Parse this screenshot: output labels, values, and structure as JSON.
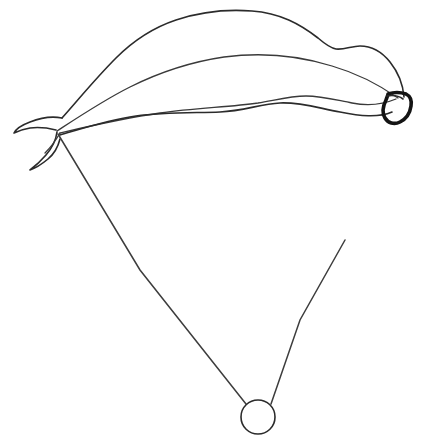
{
  "image": {
    "title": "Parachute line drawing",
    "kind": "line-art",
    "background_color": "#ffffff",
    "ink_color": "#2b2b2b",
    "heavy_ink_color": "#141414",
    "width": 426,
    "height": 446
  },
  "figure": {
    "parts": [
      {
        "name": "canopy-top-edge",
        "label": "Canopy upper outline"
      },
      {
        "name": "canopy-mid-seam",
        "label": "Canopy middle seam"
      },
      {
        "name": "canopy-inner-seam",
        "label": "Canopy inner seam"
      },
      {
        "name": "canopy-bottom-edge",
        "label": "Canopy lower outline"
      },
      {
        "name": "canopy-left-tip",
        "label": "Left canopy tip"
      },
      {
        "name": "canopy-right-tip",
        "label": "Right canopy tip hook"
      },
      {
        "name": "suspension-line-left",
        "label": "Left suspension line"
      },
      {
        "name": "suspension-line-right",
        "label": "Right suspension line"
      },
      {
        "name": "payload-ring",
        "label": "Payload ring"
      }
    ]
  },
  "geometry": {
    "canopy_top_peak": {
      "x": 250,
      "y": 11
    },
    "canopy_left_tip": {
      "x": 18,
      "y": 127
    },
    "canopy_right_tip": {
      "x": 404,
      "y": 100
    },
    "line_left_anchor": {
      "x": 58,
      "y": 134
    },
    "line_right_anchor": {
      "x": 345,
      "y": 240
    },
    "ring_center": {
      "x": 258,
      "y": 417
    },
    "ring_radius": 17
  },
  "paths": {
    "canopy_top_edge": "M 62,118 C 78,100 96,78 116,58 C 134,40 152,28 176,20 C 200,12 226,9 252,11 C 280,13 300,24 318,38 C 325,44 330,48 336,49 C 344,50 352,46 360,46 C 372,46 382,52 390,62 C 398,72 403,84 404,97",
    "canopy_mid_seam": "M 57,131 C 80,116 104,100 130,87 C 158,73 190,62 224,57 C 262,52 300,56 332,66 C 356,73 378,84 398,98",
    "canopy_inner_seam": "M 60,133 C 90,126 124,118 160,113 C 196,108 230,107 258,103 C 276,100 290,96 306,96 C 322,96 336,100 352,103 C 368,106 384,104 396,99",
    "canopy_bottom_edge": "M 60,135 C 84,128 108,120 136,116 C 164,112 196,113 220,112 C 244,111 260,104 280,103 C 300,102 318,108 340,112 C 360,116 378,118 392,112",
    "canopy_left_tip_upper": "M 62,118 C 52,116 40,118 30,122 C 22,125 16,129 14,133 C 18,131 24,129 30,128 C 38,127 48,128 56,130",
    "canopy_left_tip_lower": "M 57,132 C 56,140 52,148 46,155 C 40,162 34,167 30,170 C 36,168 42,164 48,159 C 54,154 58,147 60,139",
    "canopy_left_tip_inner": "M 60,133 C 56,140 51,147 45,153",
    "canopy_right_hook": "M 388,94 C 394,92 400,92 406,94 C 410,96 412,100 411,106 C 410,113 406,119 400,122 C 394,125 388,123 385,118 C 382,113 383,106 386,100 C 387,97 388,95 388,94 Z",
    "canopy_right_hook_inner": "M 387,96 C 393,95 399,96 403,99",
    "suspension_line_left": "M 58,134 L 140,270 L 246,404",
    "suspension_line_right": "M 345,240 L 300,320 L 271,404",
    "payload_ring": "M 258,400 C 267,400 275,407 275,417 C 275,427 267,434 258,434 C 249,434 241,427 241,417 C 241,407 249,400 258,400 Z"
  }
}
